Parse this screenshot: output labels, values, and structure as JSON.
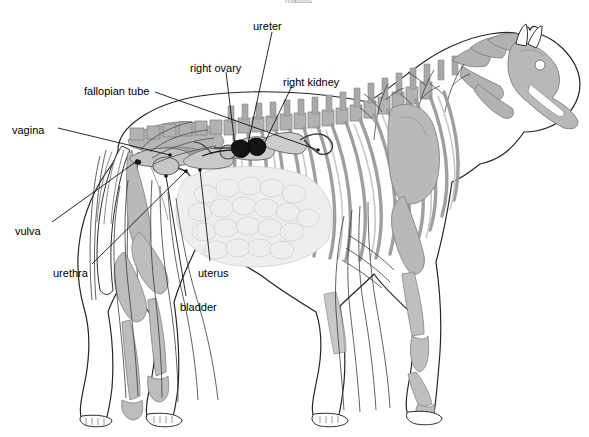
{
  "figure": {
    "title_partial": "mastitis",
    "background_color": "#ffffff",
    "line_color": "#1a1a1a",
    "label_color": "#000000",
    "bone_fill": "#b9b9b9",
    "organ_fill": "#c9c9c9",
    "kidney_fill": "#141414"
  },
  "labels": [
    {
      "id": "ureter",
      "text": "ureter",
      "x": 253,
      "y": 20
    },
    {
      "id": "right-ovary",
      "text": "right ovary",
      "x": 190,
      "y": 62
    },
    {
      "id": "right-kidney",
      "text": "right kidney",
      "x": 283,
      "y": 76
    },
    {
      "id": "fallopian-tube",
      "text": "fallopian tube",
      "x": 84,
      "y": 85
    },
    {
      "id": "vagina",
      "text": "vagina",
      "x": 12,
      "y": 124
    },
    {
      "id": "vulva",
      "text": "vulva",
      "x": 15,
      "y": 225
    },
    {
      "id": "urethra",
      "text": "urethra",
      "x": 53,
      "y": 267
    },
    {
      "id": "uterus",
      "text": "uterus",
      "x": 198,
      "y": 267
    },
    {
      "id": "bladder",
      "text": "bladder",
      "x": 180,
      "y": 301
    }
  ],
  "leaders": [
    {
      "id": "ureter-leader",
      "points": "272,32 247,148"
    },
    {
      "id": "right-ovary-leader",
      "points": "226,72 236,147"
    },
    {
      "id": "right-kidney-leader",
      "points": "292,86 265,144"
    },
    {
      "id": "fallopian-tube-leader",
      "points": "155,92 211,157"
    },
    {
      "id": "vagina-leader",
      "points": "58,128 185,152"
    },
    {
      "id": "vulva-leader",
      "points": "52,222 137,158"
    },
    {
      "id": "urethra-leader",
      "points": "92,264 182,167"
    },
    {
      "id": "uterus-leader",
      "points": "210,261 196,170"
    },
    {
      "id": "bladder-leader",
      "points": "186,296 165,168"
    }
  ]
}
